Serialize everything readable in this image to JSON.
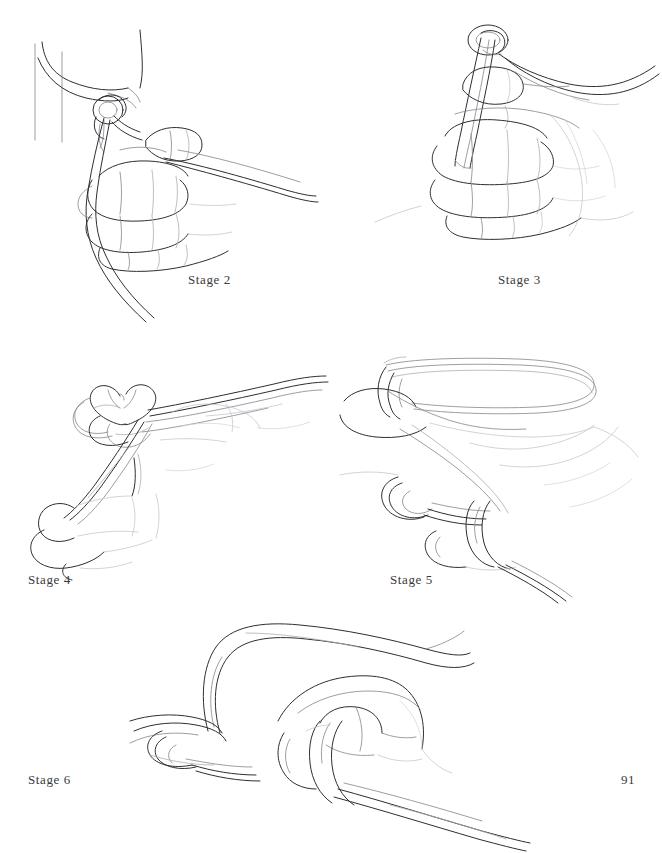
{
  "page": {
    "width": 662,
    "height": 853,
    "background_color": "#ffffff",
    "folio_number": "91",
    "ink_color": "#2e2e33"
  },
  "figures": [
    {
      "id": "stage-2",
      "caption": "Stage 2",
      "caption_x": 188,
      "caption_y": 272,
      "subject": "hand holding rope with hitch formed around a vertical post",
      "elements": [
        "vertical post",
        "rope loop over post",
        "knot bight",
        "closed fist",
        "four fingers",
        "thumb",
        "two rope tails hanging down",
        "standing part running right"
      ]
    },
    {
      "id": "stage-3",
      "caption": "Stage 3",
      "caption_x": 498,
      "caption_y": 272,
      "subject": "fist gripping doubled rope pulled up through a small loop at top",
      "elements": [
        "small ring loop at top",
        "doubled rope column",
        "closed fist",
        "four fingers",
        "thumb",
        "two rope strands exiting upper right"
      ]
    },
    {
      "id": "stage-4",
      "caption": "Stage 4",
      "caption_x": 28,
      "caption_y": 572,
      "subject": "hand drawing a bight of rope through a loose overhand loop",
      "elements": [
        "heart shaped bight",
        "tangle of loops",
        "rope strands running upper right",
        "fingers of fist",
        "thumb"
      ]
    },
    {
      "id": "stage-5",
      "caption": "Stage 5",
      "caption_x": 390,
      "caption_y": 572,
      "subject": "large bight of rope laid over the index finger with a loop captured below",
      "elements": [
        "large rope bight across top",
        "index finger",
        "knuckles",
        "captured loop at lower left",
        "rope collar around finger",
        "strands exiting lower right"
      ]
    },
    {
      "id": "stage-6",
      "caption": "Stage 6",
      "caption_x": 28,
      "caption_y": 772,
      "subject": "finished knot drawn snug, finger inside the loop, bight standing up",
      "elements": [
        "standing bight curving up and right",
        "fist seen from above",
        "collar of rope around finger",
        "loops at left",
        "standing part running lower right"
      ]
    }
  ]
}
